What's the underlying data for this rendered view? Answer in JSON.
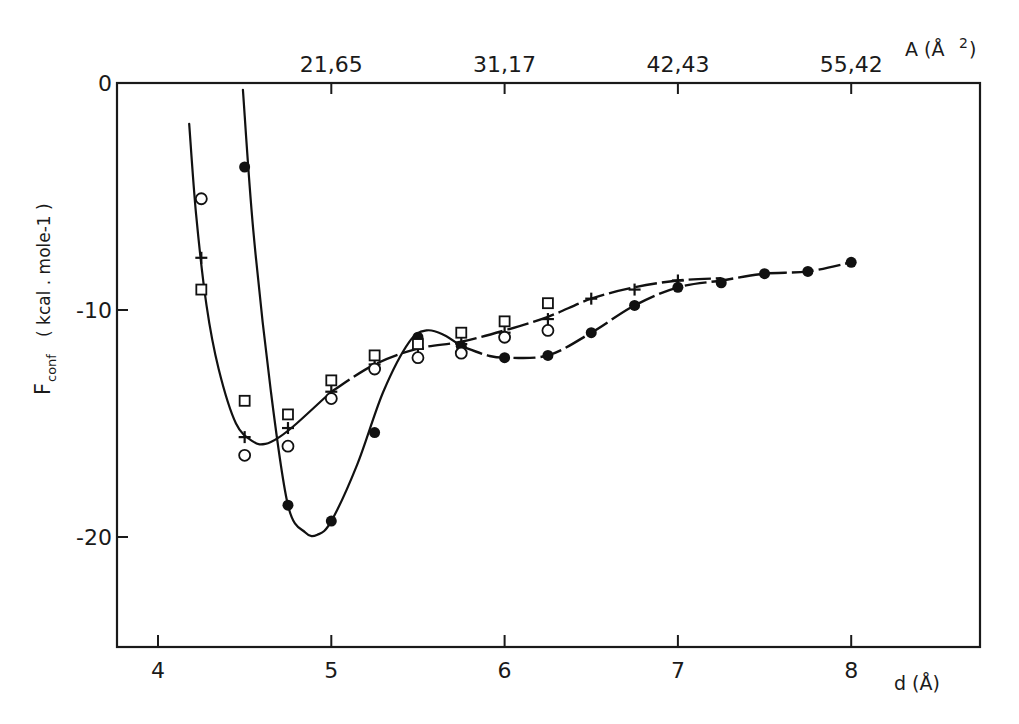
{
  "chart_data": {
    "type": "scatter",
    "title": "",
    "xlabel": "d (Å)",
    "ylabel": "F_conf (kcal . mole-1 )",
    "ylabel_main": "F",
    "ylabel_sub": "conf",
    "ylabel_units": "( kcal . mole-1 )",
    "top_axis_label": "A (Å2)",
    "top_axis_label_main": "A (Å",
    "top_axis_label_sup": "2",
    "top_axis_label_close": ")",
    "xlim": [
      3.77,
      8.74
    ],
    "ylim": [
      -25,
      0
    ],
    "xticks": [
      "4",
      "5",
      "6",
      "7",
      "8"
    ],
    "xtick_values": [
      4,
      5,
      6,
      7,
      8
    ],
    "yticks": [
      "0",
      "-10",
      "-20"
    ],
    "ytick_values": [
      0,
      -10,
      -20
    ],
    "top_ticks": [
      {
        "d": 5,
        "label": "21,65"
      },
      {
        "d": 6,
        "label": "31,17"
      },
      {
        "d": 7,
        "label": "42,43"
      },
      {
        "d": 8,
        "label": "55,42"
      }
    ],
    "grid": false,
    "legend": "none",
    "series": [
      {
        "name": "filled circles",
        "marker": "filled-circle",
        "x": [
          4.5,
          4.75,
          5.0,
          5.25,
          5.5,
          5.75,
          6.0,
          6.25,
          6.5,
          6.75,
          7.0,
          7.25,
          7.5,
          7.75,
          8.0
        ],
        "y": [
          -3.7,
          -18.6,
          -19.3,
          -15.4,
          -11.2,
          -11.6,
          -12.1,
          -12.0,
          -11.0,
          -9.8,
          -9.0,
          -8.8,
          -8.4,
          -8.3,
          -7.9
        ]
      },
      {
        "name": "crosses",
        "marker": "plus",
        "x": [
          4.25,
          4.5,
          4.75,
          5.0,
          5.25,
          5.5,
          5.75,
          6.0,
          6.25,
          6.5,
          6.75,
          7.0
        ],
        "y": [
          -7.7,
          -15.6,
          -15.2,
          -13.6,
          -12.4,
          -11.7,
          -11.5,
          -11.0,
          -10.4,
          -9.5,
          -9.1,
          -8.7
        ]
      },
      {
        "name": "open circles",
        "marker": "open-circle",
        "x": [
          4.25,
          4.5,
          4.75,
          5.0,
          5.25,
          5.5,
          5.75,
          6.0,
          6.25
        ],
        "y": [
          -5.1,
          -16.4,
          -16.0,
          -13.9,
          -12.6,
          -12.1,
          -11.9,
          -11.2,
          -10.9
        ]
      },
      {
        "name": "open squares",
        "marker": "open-square",
        "x": [
          4.25,
          4.5,
          4.75,
          5.0,
          5.25,
          5.5,
          5.75,
          6.0,
          6.25
        ],
        "y": [
          -9.1,
          -14.0,
          -14.6,
          -13.1,
          -12.0,
          -11.5,
          -11.0,
          -10.5,
          -9.7
        ]
      }
    ],
    "fitted_curves": [
      {
        "name": "filled-circle fit",
        "style": "solid then dashed",
        "x": [
          4.49,
          4.55,
          4.65,
          4.75,
          4.85,
          4.92,
          5.0,
          5.15,
          5.3,
          5.45,
          5.55,
          5.65,
          5.75,
          5.9,
          6.0,
          6.25,
          6.5,
          6.75,
          7.0,
          7.25,
          7.5,
          7.75,
          8.0
        ],
        "y": [
          -0.3,
          -6.5,
          -13.5,
          -18.6,
          -19.8,
          -19.9,
          -19.3,
          -16.8,
          -13.6,
          -11.4,
          -10.9,
          -11.1,
          -11.6,
          -12.0,
          -12.1,
          -12.0,
          -11.0,
          -9.8,
          -9.0,
          -8.7,
          -8.4,
          -8.3,
          -7.9
        ]
      },
      {
        "name": "cross fit",
        "style": "solid then dashed",
        "x": [
          4.18,
          4.22,
          4.28,
          4.35,
          4.45,
          4.55,
          4.62,
          4.7,
          4.8,
          5.0,
          5.25,
          5.5,
          5.75,
          6.0,
          6.25,
          6.5,
          6.75,
          7.0,
          7.25
        ],
        "y": [
          -1.8,
          -5.8,
          -9.8,
          -12.6,
          -15.0,
          -15.8,
          -15.9,
          -15.6,
          -15.0,
          -13.6,
          -12.4,
          -11.7,
          -11.4,
          -10.9,
          -10.3,
          -9.5,
          -9.0,
          -8.7,
          -8.6
        ]
      }
    ]
  }
}
